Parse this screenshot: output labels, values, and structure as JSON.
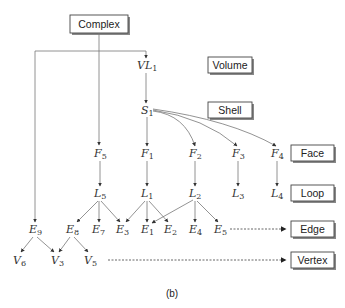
{
  "diagram": {
    "caption": "(b)",
    "root_box": {
      "label": "Complex",
      "x": 70,
      "y": 15,
      "w": 58,
      "h": 18
    },
    "level_boxes": [
      {
        "id": "volume",
        "label": "Volume",
        "x": 208,
        "y": 57,
        "w": 44,
        "h": 16
      },
      {
        "id": "shell",
        "label": "Shell",
        "x": 208,
        "y": 102,
        "w": 44,
        "h": 16
      },
      {
        "id": "face",
        "label": "Face",
        "x": 291,
        "y": 145,
        "w": 43,
        "h": 16
      },
      {
        "id": "loop",
        "label": "Loop",
        "x": 291,
        "y": 185,
        "w": 43,
        "h": 16
      },
      {
        "id": "edge",
        "label": "Edge",
        "x": 291,
        "y": 221,
        "w": 43,
        "h": 16
      },
      {
        "id": "vertex",
        "label": "Vertex",
        "x": 291,
        "y": 252,
        "w": 43,
        "h": 16
      }
    ],
    "nodes": [
      {
        "id": "VL1",
        "base": "VL",
        "sub": "1",
        "x": 146,
        "y": 69
      },
      {
        "id": "S1",
        "base": "S",
        "sub": "1",
        "x": 146,
        "y": 114
      },
      {
        "id": "F5",
        "base": "F",
        "sub": "5",
        "x": 100,
        "y": 157
      },
      {
        "id": "F1",
        "base": "F",
        "sub": "1",
        "x": 147,
        "y": 157
      },
      {
        "id": "F2",
        "base": "F",
        "sub": "2",
        "x": 195,
        "y": 157
      },
      {
        "id": "F3",
        "base": "F",
        "sub": "3",
        "x": 238,
        "y": 157
      },
      {
        "id": "F4",
        "base": "F",
        "sub": "4",
        "x": 277,
        "y": 157
      },
      {
        "id": "L5",
        "base": "L",
        "sub": "5",
        "x": 100,
        "y": 197
      },
      {
        "id": "L1",
        "base": "L",
        "sub": "1",
        "x": 147,
        "y": 197
      },
      {
        "id": "L2",
        "base": "L",
        "sub": "2",
        "x": 195,
        "y": 197
      },
      {
        "id": "L3",
        "base": "L",
        "sub": "3",
        "x": 238,
        "y": 197
      },
      {
        "id": "L4",
        "base": "L",
        "sub": "4",
        "x": 277,
        "y": 197
      },
      {
        "id": "E9",
        "base": "E",
        "sub": "9",
        "x": 35,
        "y": 233
      },
      {
        "id": "E8",
        "base": "E",
        "sub": "8",
        "x": 72,
        "y": 233
      },
      {
        "id": "E7",
        "base": "E",
        "sub": "7",
        "x": 98,
        "y": 233
      },
      {
        "id": "E3",
        "base": "E",
        "sub": "3",
        "x": 122,
        "y": 233
      },
      {
        "id": "E1",
        "base": "E",
        "sub": "1",
        "x": 147,
        "y": 233
      },
      {
        "id": "E2",
        "base": "E",
        "sub": "2",
        "x": 170,
        "y": 233
      },
      {
        "id": "E4",
        "base": "E",
        "sub": "4",
        "x": 195,
        "y": 233
      },
      {
        "id": "E5",
        "base": "E",
        "sub": "5",
        "x": 220,
        "y": 233
      },
      {
        "id": "V6",
        "base": "V",
        "sub": "6",
        "x": 20,
        "y": 263
      },
      {
        "id": "V3",
        "base": "V",
        "sub": "3",
        "x": 57,
        "y": 263
      },
      {
        "id": "V5",
        "base": "V",
        "sub": "5",
        "x": 90,
        "y": 263
      }
    ],
    "edges": [
      [
        "Complex",
        "VL1"
      ],
      [
        "Complex",
        "F5"
      ],
      [
        "Complex",
        "E9"
      ],
      [
        "VL1",
        "S1"
      ],
      [
        "S1",
        "F1"
      ],
      [
        "S1",
        "F2"
      ],
      [
        "S1",
        "F3"
      ],
      [
        "S1",
        "F4"
      ],
      [
        "F5",
        "L5"
      ],
      [
        "F1",
        "L1"
      ],
      [
        "F2",
        "L2"
      ],
      [
        "F3",
        "L3"
      ],
      [
        "F4",
        "L4"
      ],
      [
        "L5",
        "E8"
      ],
      [
        "L5",
        "E7"
      ],
      [
        "L5",
        "E3"
      ],
      [
        "L1",
        "E3"
      ],
      [
        "L1",
        "E1"
      ],
      [
        "L1",
        "E2"
      ],
      [
        "L2",
        "E1"
      ],
      [
        "L2",
        "E4"
      ],
      [
        "L2",
        "E5"
      ],
      [
        "E9",
        "V6"
      ],
      [
        "E9",
        "V3"
      ],
      [
        "E8",
        "V3"
      ],
      [
        "E8",
        "V5"
      ]
    ],
    "dashed_arrows": [
      {
        "from": "E5",
        "to": "Edge"
      },
      {
        "from": "V5",
        "to": "Vertex"
      }
    ]
  }
}
